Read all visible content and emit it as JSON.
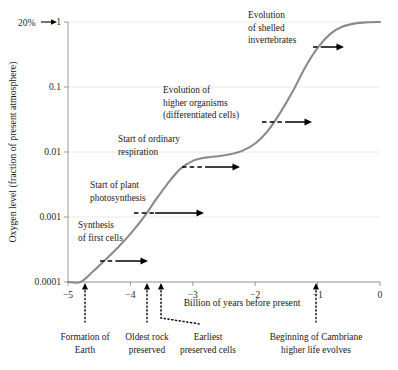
{
  "chart_data": {
    "type": "line",
    "title": "",
    "xlabel": "Billion of years before present",
    "ylabel": "Oxygen level (fraction of present atmosphere)",
    "xlim": [
      -5,
      0
    ],
    "ylim_log": [
      0.0001,
      1
    ],
    "xticks": [
      -5,
      -4,
      -3,
      -2,
      -1,
      0
    ],
    "xtick_labels": [
      "−5",
      "−4",
      "−3",
      "−2",
      "−1",
      "0"
    ],
    "yticks": [
      1,
      0.1,
      0.01,
      0.001,
      0.0001
    ],
    "ytick_labels": [
      "1",
      "0.1",
      "0.01",
      "0.001",
      "0.0001"
    ],
    "grid": true,
    "legend": "none",
    "series": [
      {
        "name": "Atmospheric oxygen",
        "color": "#8a8a8a",
        "points": [
          [
            -5.0,
            0.0001
          ],
          [
            -4.8,
            0.0001
          ],
          [
            -4.6,
            0.000145
          ],
          [
            -4.4,
            0.00022
          ],
          [
            -4.2,
            0.00034
          ],
          [
            -4.0,
            0.00055
          ],
          [
            -3.8,
            0.00095
          ],
          [
            -3.6,
            0.0018
          ],
          [
            -3.4,
            0.0033
          ],
          [
            -3.2,
            0.0055
          ],
          [
            -3.0,
            0.0073
          ],
          [
            -2.8,
            0.0082
          ],
          [
            -2.6,
            0.0086
          ],
          [
            -2.4,
            0.0092
          ],
          [
            -2.2,
            0.0105
          ],
          [
            -2.0,
            0.0135
          ],
          [
            -1.8,
            0.021
          ],
          [
            -1.6,
            0.04
          ],
          [
            -1.4,
            0.085
          ],
          [
            -1.2,
            0.2
          ],
          [
            -1.0,
            0.4
          ],
          [
            -0.8,
            0.65
          ],
          [
            -0.6,
            0.85
          ],
          [
            -0.4,
            0.95
          ],
          [
            -0.2,
            0.99
          ],
          [
            0.0,
            1.0
          ]
        ]
      }
    ],
    "top_annotation": {
      "label": "20%",
      "points_to": "1",
      "icon": "right-arrow-icon"
    },
    "event_annotations": [
      {
        "id": "synthesis-first-cells",
        "lines": [
          "Synthesis",
          "of first cells"
        ],
        "text_x": 78,
        "text_y": 228,
        "dash_x1": 100,
        "dash_x2": 118,
        "arrow_x1": 118,
        "arrow_x2": 148,
        "arrow_y": 261
      },
      {
        "id": "start-plant-photosynthesis",
        "lines": [
          "Start of plant",
          "photosynthesis"
        ],
        "text_x": 90,
        "text_y": 188,
        "dash_x1": 134,
        "dash_x2": 155,
        "arrow_x1": 155,
        "arrow_x2": 204,
        "arrow_y": 213
      },
      {
        "id": "start-ordinary-respiration",
        "lines": [
          "Start of ordinary",
          "respiration"
        ],
        "text_x": 118,
        "text_y": 142,
        "dash_x1": 182,
        "dash_x2": 207,
        "arrow_x1": 207,
        "arrow_x2": 240,
        "arrow_y": 167
      },
      {
        "id": "evolution-higher-organisms",
        "lines": [
          "Evolution of",
          "higher organisms",
          "(differentiated cells)"
        ],
        "text_x": 163,
        "text_y": 93,
        "dash_x1": 262,
        "dash_x2": 288,
        "arrow_x1": 288,
        "arrow_x2": 312,
        "arrow_y": 122
      },
      {
        "id": "evolution-shelled-invertebrates",
        "lines": [
          "Evolution",
          "of shelled",
          "invertebrates"
        ],
        "text_x": 248,
        "text_y": 18,
        "dash_x1": 313,
        "dash_x2": 322,
        "arrow_x1": 322,
        "arrow_x2": 344,
        "arrow_y": 47
      }
    ],
    "axis_pointers": [
      {
        "id": "formation-of-earth",
        "lines": [
          "Formation of",
          "Earth"
        ],
        "tick_x": 85,
        "label_cx": 85,
        "label_y": 340,
        "bent": false
      },
      {
        "id": "oldest-rock-preserved",
        "lines": [
          "Oldest rock",
          "preserved"
        ],
        "tick_x": 147,
        "label_cx": 147,
        "label_y": 340,
        "bent": false
      },
      {
        "id": "earliest-preserved-cells",
        "lines": [
          "Earliest",
          "preserved cells"
        ],
        "tick_x": 161,
        "label_cx": 208,
        "label_y": 340,
        "bent": true
      },
      {
        "id": "beginning-of-cambriane",
        "lines": [
          "Beginning of Cambriane",
          "higher life evolves"
        ],
        "tick_x": 316,
        "label_cx": 316,
        "label_y": 340,
        "bent": false
      }
    ]
  }
}
